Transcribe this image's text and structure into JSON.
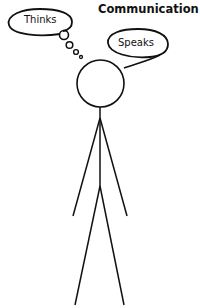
{
  "diagram": {
    "title": "Communication",
    "thought_bubble": {
      "label": "Thinks"
    },
    "speech_bubble": {
      "label": "Speaks"
    },
    "figure": {
      "description": "stick-figure"
    },
    "colors": {
      "stroke": "#111111",
      "background": "#ffffff"
    }
  }
}
